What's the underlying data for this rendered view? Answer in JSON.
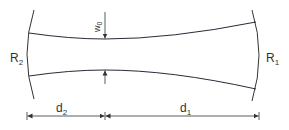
{
  "diagram": {
    "type": "gaussian-beam-resonator",
    "labels": {
      "mirror_left": "R",
      "mirror_left_sub": "2",
      "mirror_right": "R",
      "mirror_right_sub": "1",
      "waist": "w",
      "waist_sub": "0",
      "dist_left": "d",
      "dist_left_sub": "2",
      "dist_right": "d",
      "dist_right_sub": "1"
    },
    "colors": {
      "line": "#333333",
      "beam": "#2a2a3a",
      "background": "#ffffff"
    }
  }
}
